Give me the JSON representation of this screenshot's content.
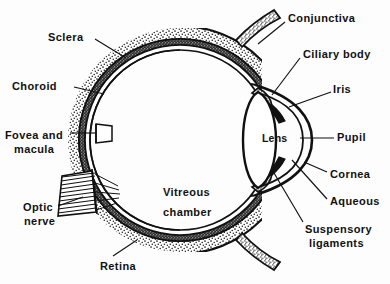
{
  "figure": {
    "kind": "anatomical-diagram",
    "style": "black-and-white line drawing with stippled and hatched shading",
    "background_color": "#fdfdfd",
    "ink_color": "#111111"
  },
  "labels": [
    {
      "id": "sclera",
      "text": "Sclera",
      "x": 48,
      "y": 31,
      "align": "left"
    },
    {
      "id": "choroid",
      "text": "Choroid",
      "x": 12,
      "y": 80,
      "align": "left"
    },
    {
      "id": "fovea",
      "text": "Fovea and",
      "x": 5,
      "y": 129,
      "align": "left"
    },
    {
      "id": "macula",
      "text": "macula",
      "x": 14,
      "y": 143,
      "align": "left"
    },
    {
      "id": "optic",
      "text": "Optic",
      "x": 23,
      "y": 201,
      "align": "left"
    },
    {
      "id": "nerve",
      "text": "nerve",
      "x": 24,
      "y": 215,
      "align": "left"
    },
    {
      "id": "retina",
      "text": "Retina",
      "x": 100,
      "y": 260,
      "align": "left"
    },
    {
      "id": "vitreous1",
      "text": "Vitreous",
      "x": 163,
      "y": 186,
      "align": "left"
    },
    {
      "id": "vitreous2",
      "text": "chamber",
      "x": 163,
      "y": 206,
      "align": "left"
    },
    {
      "id": "lens",
      "text": "Lens",
      "x": 262,
      "y": 132,
      "align": "left"
    },
    {
      "id": "conjunctiva",
      "text": "Conjunctiva",
      "x": 288,
      "y": 12,
      "align": "left"
    },
    {
      "id": "ciliary",
      "text": "Ciliary body",
      "x": 303,
      "y": 48,
      "align": "left"
    },
    {
      "id": "iris",
      "text": "Iris",
      "x": 333,
      "y": 83,
      "align": "left"
    },
    {
      "id": "pupil",
      "text": "Pupil",
      "x": 337,
      "y": 131,
      "align": "left"
    },
    {
      "id": "cornea",
      "text": "Cornea",
      "x": 330,
      "y": 168,
      "align": "left"
    },
    {
      "id": "aqueous",
      "text": "Aqueous",
      "x": 330,
      "y": 195,
      "align": "left"
    },
    {
      "id": "suspensory1",
      "text": "Suspensory",
      "x": 305,
      "y": 223,
      "align": "left"
    },
    {
      "id": "suspensory2",
      "text": "ligaments",
      "x": 309,
      "y": 237,
      "align": "left"
    }
  ],
  "leader_lines": [
    {
      "id": "sclera-leader",
      "from": [
        95,
        39
      ],
      "to": [
        126,
        58
      ]
    },
    {
      "id": "choroid-leader",
      "from": [
        74,
        87
      ],
      "to": [
        104,
        94
      ]
    },
    {
      "id": "fovea-leader",
      "from": [
        70,
        133
      ],
      "to": [
        96,
        133
      ]
    },
    {
      "id": "optic-leader",
      "from": [
        58,
        206
      ],
      "to": [
        83,
        197
      ]
    },
    {
      "id": "retina-leader",
      "from": [
        113,
        256
      ],
      "to": [
        137,
        240
      ]
    },
    {
      "id": "conjunctiva-leader",
      "from": [
        285,
        22
      ],
      "to": [
        258,
        44
      ]
    },
    {
      "id": "ciliary-leader",
      "from": [
        300,
        58
      ],
      "to": [
        272,
        95
      ]
    },
    {
      "id": "iris-leader",
      "from": [
        331,
        92
      ],
      "to": [
        289,
        107
      ]
    },
    {
      "id": "pupil-leader",
      "from": [
        334,
        138
      ],
      "to": [
        300,
        138
      ]
    },
    {
      "id": "cornea-leader",
      "from": [
        327,
        172
      ],
      "to": [
        304,
        162
      ]
    },
    {
      "id": "aqueous-leader",
      "from": [
        327,
        199
      ],
      "to": [
        292,
        160
      ]
    },
    {
      "id": "suspensory-leader",
      "from": [
        303,
        222
      ],
      "to": [
        274,
        173
      ]
    }
  ],
  "structures": {
    "globe": {
      "name": "eyeball globe",
      "center": [
        180,
        140
      ],
      "radius_outer": 112,
      "layers": [
        "sclera",
        "choroid",
        "retina"
      ]
    },
    "anterior": {
      "name": "anterior segment",
      "parts": [
        "cornea",
        "aqueous humor",
        "iris",
        "pupil",
        "lens",
        "ciliary body",
        "suspensory ligaments"
      ]
    },
    "optic_nerve": {
      "name": "optic nerve",
      "shading": "hatched"
    },
    "conjunctiva_flaps": {
      "name": "conjunctiva reflected flaps",
      "count": 2
    }
  }
}
